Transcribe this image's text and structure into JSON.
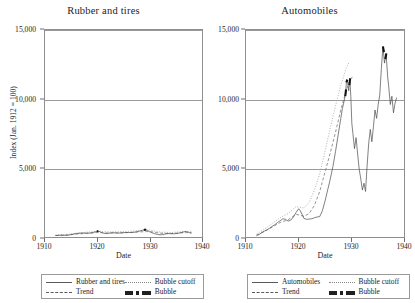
{
  "figure": {
    "yaxis_title": "Index (Jan. 1912 = 100)",
    "xaxis_title": "Date"
  },
  "panels": [
    {
      "title": "Rubber and tires",
      "legend": [
        {
          "label": "Rubber and tires",
          "style": "solid"
        },
        {
          "label": "Bubble cutoff",
          "style": "dotted"
        },
        {
          "label": "Trend",
          "style": "dashed"
        },
        {
          "label": "Bubble",
          "style": "dashdot"
        }
      ]
    },
    {
      "title": "Automobiles",
      "legend": [
        {
          "label": "Automobiles",
          "style": "solid"
        },
        {
          "label": "Bubble cutoff",
          "style": "dotted"
        },
        {
          "label": "Trend",
          "style": "dashed"
        },
        {
          "label": "Bubble",
          "style": "dashdot"
        }
      ]
    }
  ],
  "axes": {
    "y_ticks": [
      "0",
      "5,000",
      "10,000",
      "15,000"
    ],
    "y_tick_values": [
      0,
      5000,
      10000,
      15000
    ],
    "x_ticks": [
      "1910",
      "1920",
      "1930",
      "1940"
    ],
    "x_tick_values": [
      1910,
      1920,
      1930,
      1940
    ]
  },
  "chart_data": [
    {
      "type": "line",
      "title": "Rubber and tires",
      "xlabel": "Date",
      "ylabel": "Index (Jan. 1912 = 100)",
      "xlim": [
        1910,
        1940
      ],
      "ylim": [
        0,
        15000
      ],
      "grid": true,
      "legend_position": "below",
      "series": [
        {
          "name": "Rubber and tires",
          "style": "solid",
          "x": [
            1912.0,
            1912.5,
            1913.0,
            1913.5,
            1914.0,
            1914.5,
            1915.0,
            1915.5,
            1916.0,
            1916.5,
            1917.0,
            1917.5,
            1918.0,
            1918.5,
            1919.0,
            1919.5,
            1920.0,
            1920.4,
            1920.8,
            1921.2,
            1921.6,
            1922.0,
            1922.5,
            1923.0,
            1923.5,
            1924.0,
            1924.5,
            1925.0,
            1925.5,
            1926.0,
            1926.5,
            1927.0,
            1927.5,
            1928.0,
            1928.5,
            1929.0,
            1929.3,
            1929.6,
            1930.0,
            1930.5,
            1931.0,
            1931.5,
            1932.0,
            1932.5,
            1933.0,
            1933.5,
            1934.0,
            1934.5,
            1935.0,
            1935.5,
            1936.0,
            1936.5,
            1937.0,
            1937.5,
            1938.0
          ],
          "values": [
            100,
            115,
            130,
            125,
            120,
            135,
            175,
            215,
            250,
            270,
            290,
            285,
            275,
            280,
            305,
            360,
            420,
            395,
            330,
            275,
            250,
            265,
            290,
            305,
            300,
            285,
            295,
            315,
            330,
            325,
            330,
            345,
            375,
            420,
            475,
            520,
            545,
            470,
            380,
            300,
            235,
            190,
            160,
            175,
            215,
            250,
            245,
            230,
            245,
            275,
            320,
            370,
            400,
            330,
            265
          ]
        },
        {
          "name": "Trend",
          "style": "dashed",
          "x": [
            1912.0,
            1914.0,
            1916.0,
            1918.0,
            1920.0,
            1922.0,
            1924.0,
            1926.0,
            1928.0,
            1930.0,
            1932.0,
            1934.0,
            1936.0,
            1938.0
          ],
          "values": [
            105,
            135,
            205,
            270,
            320,
            290,
            295,
            320,
            370,
            400,
            280,
            245,
            300,
            330
          ]
        },
        {
          "name": "Bubble cutoff",
          "style": "dotted",
          "x": [
            1912.0,
            1914.0,
            1916.0,
            1918.0,
            1920.0,
            1922.0,
            1924.0,
            1926.0,
            1928.0,
            1930.0,
            1932.0,
            1934.0,
            1936.0,
            1938.0
          ],
          "values": [
            150,
            190,
            275,
            350,
            410,
            375,
            380,
            410,
            470,
            505,
            360,
            320,
            385,
            420
          ]
        },
        {
          "name": "Bubble",
          "style": "dashdot",
          "segments": [
            {
              "x": [
                1919.9,
                1920.2
              ],
              "values": [
                415,
                420
              ]
            },
            {
              "x": [
                1928.9,
                1929.3
              ],
              "values": [
                500,
                545
              ]
            }
          ]
        }
      ]
    },
    {
      "type": "line",
      "title": "Automobiles",
      "xlabel": "Date",
      "ylabel": "Index (Jan. 1912 = 100)",
      "xlim": [
        1910,
        1940
      ],
      "ylim": [
        0,
        15000
      ],
      "grid": true,
      "legend_position": "below",
      "series": [
        {
          "name": "Automobiles",
          "style": "solid",
          "x": [
            1912.0,
            1912.5,
            1913.0,
            1913.5,
            1914.0,
            1914.5,
            1915.0,
            1915.5,
            1916.0,
            1916.5,
            1917.0,
            1917.5,
            1918.0,
            1918.5,
            1919.0,
            1919.5,
            1920.0,
            1920.3,
            1920.7,
            1921.0,
            1921.5,
            1922.0,
            1922.5,
            1923.0,
            1923.5,
            1924.0,
            1924.5,
            1925.0,
            1925.5,
            1926.0,
            1926.5,
            1927.0,
            1927.5,
            1928.0,
            1928.3,
            1928.6,
            1928.9,
            1929.1,
            1929.3,
            1929.5,
            1929.7,
            1929.9,
            1930.1,
            1930.3,
            1930.6,
            1930.9,
            1931.2,
            1931.5,
            1931.8,
            1932.1,
            1932.4,
            1932.7,
            1933.0,
            1933.3,
            1933.6,
            1933.9,
            1934.2,
            1934.5,
            1934.8,
            1935.1,
            1935.4,
            1935.7,
            1936.0,
            1936.3,
            1936.6,
            1936.9,
            1937.1,
            1937.4,
            1937.7,
            1938.0,
            1938.3,
            1938.6
          ],
          "values": [
            100,
            180,
            320,
            430,
            520,
            640,
            780,
            900,
            1050,
            1180,
            1320,
            1280,
            1150,
            1220,
            1450,
            1780,
            2050,
            1900,
            1600,
            1350,
            1280,
            1300,
            1320,
            1400,
            1450,
            1480,
            1900,
            2600,
            3400,
            4200,
            5100,
            6200,
            7400,
            8600,
            9300,
            9800,
            10400,
            11400,
            11200,
            10600,
            11500,
            10200,
            8200,
            7500,
            6400,
            7200,
            6000,
            4900,
            4200,
            3400,
            3900,
            3300,
            5200,
            6800,
            7800,
            6900,
            8000,
            9200,
            8600,
            9600,
            10300,
            12200,
            13800,
            12600,
            13300,
            11600,
            10900,
            9600,
            10200,
            9000,
            9700,
            10100
          ]
        },
        {
          "name": "Trend",
          "style": "dashed",
          "x": [
            1912.0,
            1913.5,
            1915.0,
            1916.5,
            1918.0,
            1919.5,
            1921.0,
            1922.0,
            1923.0,
            1924.0,
            1925.0,
            1926.0,
            1927.0,
            1928.0,
            1929.0,
            1929.8,
            1930.4
          ],
          "values": [
            140,
            400,
            720,
            1050,
            1250,
            1650,
            1500,
            1700,
            2300,
            3300,
            4700,
            6100,
            7600,
            9200,
            10600,
            11400,
            11700
          ]
        },
        {
          "name": "Bubble cutoff",
          "style": "dotted",
          "x": [
            1912.0,
            1913.5,
            1915.0,
            1916.5,
            1918.0,
            1919.5,
            1921.0,
            1922.0,
            1923.0,
            1924.0,
            1925.0,
            1926.0,
            1927.0,
            1928.0,
            1929.0,
            1929.6
          ],
          "values": [
            220,
            560,
            980,
            1400,
            1700,
            2200,
            2100,
            2500,
            3400,
            4600,
            6200,
            7900,
            9500,
            11000,
            12200,
            12700
          ]
        },
        {
          "name": "Bubble",
          "style": "dashdot",
          "segments": [
            {
              "x": [
                1928.85,
                1929.0
              ],
              "values": [
                10200,
                10700
              ]
            },
            {
              "x": [
                1929.05,
                1929.25
              ],
              "values": [
                11200,
                11400
              ]
            },
            {
              "x": [
                1929.62,
                1929.78
              ],
              "values": [
                11000,
                11500
              ]
            },
            {
              "x": [
                1936.0,
                1936.2
              ],
              "values": [
                13800,
                13400
              ]
            },
            {
              "x": [
                1936.45,
                1936.65
              ],
              "values": [
                12900,
                13300
              ]
            }
          ]
        }
      ]
    }
  ]
}
